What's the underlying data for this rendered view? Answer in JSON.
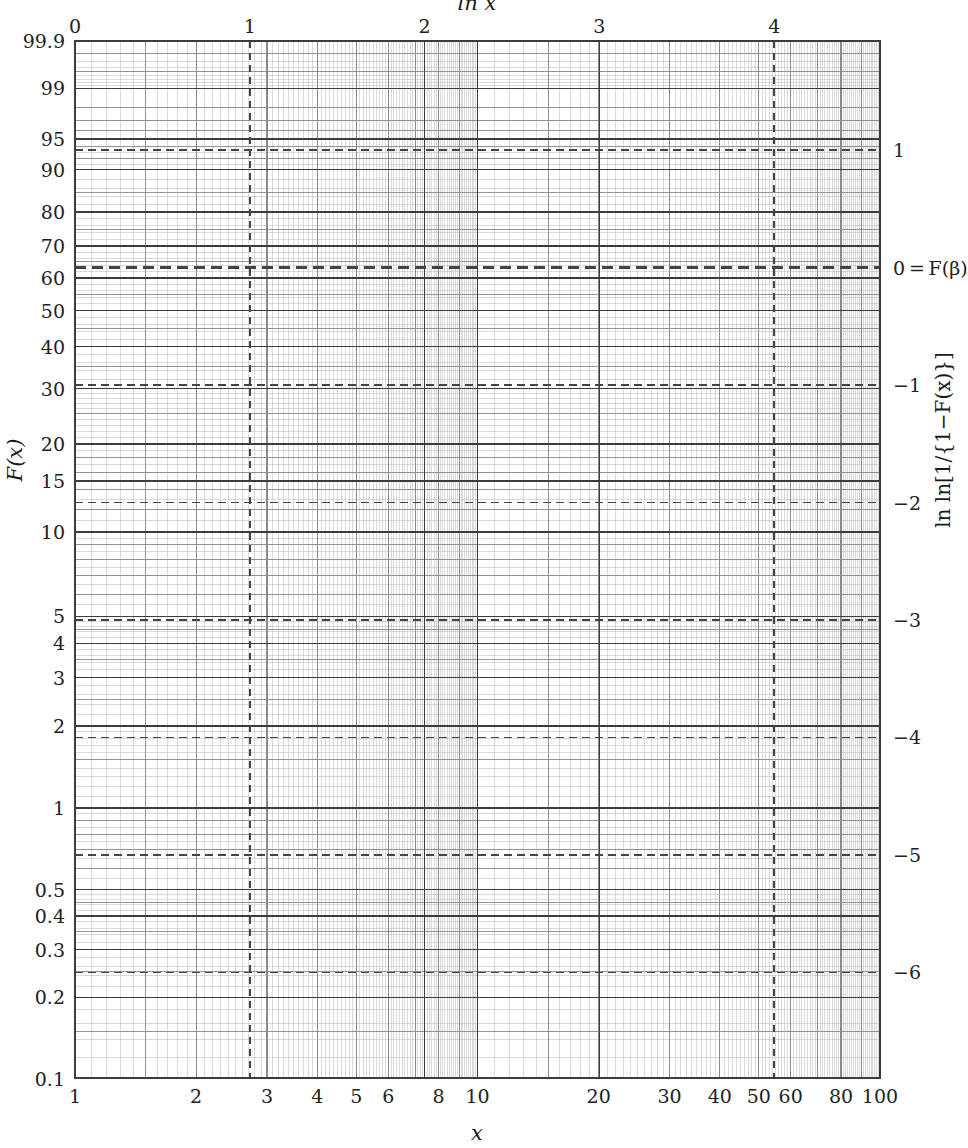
{
  "figure": {
    "type": "weibull-probability-paper",
    "width": 968,
    "height": 1148,
    "background": "#ffffff",
    "grid_color": "#3c3c3c",
    "grid_color_minor": "#8a8a8a",
    "grid_color_fine": "#b5b5b5",
    "dash_color": "#444444"
  },
  "axes": {
    "top": {
      "title": "ln x",
      "ticks": [
        "0",
        "1",
        "2",
        "3",
        "4"
      ],
      "values": [
        0,
        1,
        2,
        3,
        4
      ],
      "range": [
        0,
        4.60517
      ]
    },
    "bottom": {
      "title": "x",
      "ticks": [
        "1",
        "2",
        "3",
        "4",
        "5",
        "6",
        "8",
        "10",
        "20",
        "30",
        "40",
        "50",
        "60",
        "80",
        "100"
      ],
      "values": [
        1,
        2,
        3,
        4,
        5,
        6,
        8,
        10,
        20,
        30,
        40,
        50,
        60,
        80,
        100
      ],
      "scale": "log10",
      "range": [
        1,
        100
      ]
    },
    "left": {
      "title": "F(x)",
      "unit": "percent",
      "ticks": [
        "99.9",
        "99",
        "95",
        "90",
        "80",
        "70",
        "60",
        "50",
        "40",
        "30",
        "20",
        "15",
        "10",
        "5",
        "4",
        "3",
        "2",
        "1",
        "0.5",
        "0.4",
        "0.3",
        "0.2",
        "0.1"
      ],
      "values": [
        99.9,
        99,
        95,
        90,
        80,
        70,
        60,
        50,
        40,
        30,
        20,
        15,
        10,
        5,
        4,
        3,
        2,
        1,
        0.5,
        0.4,
        0.3,
        0.2,
        0.1
      ],
      "range": [
        0.1,
        99.9
      ]
    },
    "right": {
      "title": "ln ln[1/{1−F(x)}]",
      "ticks": [
        "1",
        "0 = F(β)",
        "−1",
        "−2",
        "−3",
        "−4",
        "−5",
        "−6"
      ],
      "values": [
        1,
        0,
        -1,
        -2,
        -3,
        -4,
        -5,
        -6
      ],
      "range": [
        -6.9,
        1.93
      ]
    }
  },
  "chart_data": {
    "type": "grid",
    "title": "",
    "xlabel": "x",
    "ylabel": "F(x)",
    "x2label": "ln x",
    "y2label": "ln ln[1/{1−F(x)}]",
    "grid": "on",
    "legend": "none",
    "xscale": "log",
    "yscale": "weibull (double-log)",
    "xlim": [
      1,
      100
    ],
    "ylim_percent": [
      0.1,
      99.9
    ],
    "ylim_lnln": [
      -6.9,
      1.93
    ],
    "xlim_lnx": [
      0,
      4.60517
    ],
    "series": [],
    "annotations": [
      {
        "kind": "dashed-vertical",
        "label": "ln x = 1",
        "x_value": 2.71828,
        "lnx": 1
      },
      {
        "kind": "dashed-vertical",
        "label": "ln x = 4",
        "x_value": 54.598,
        "lnx": 4
      },
      {
        "kind": "dashed-horizontal",
        "label": "1",
        "lnln": 1,
        "percent": 93.4
      },
      {
        "kind": "dashed-horizontal-bold",
        "label": "0 = F(β)",
        "lnln": 0,
        "percent": 63.2
      },
      {
        "kind": "dashed-horizontal",
        "label": "−1",
        "lnln": -1,
        "percent": 30.8
      },
      {
        "kind": "dashed-horizontal",
        "label": "−2",
        "lnln": -2,
        "percent": 12.7
      },
      {
        "kind": "dashed-horizontal",
        "label": "−3",
        "lnln": -3,
        "percent": 4.88
      },
      {
        "kind": "dashed-horizontal",
        "label": "−4",
        "lnln": -4,
        "percent": 1.82
      },
      {
        "kind": "dashed-horizontal",
        "label": "−5",
        "lnln": -5,
        "percent": 0.673
      },
      {
        "kind": "dashed-horizontal",
        "label": "−6",
        "lnln": -6,
        "percent": 0.248
      }
    ]
  },
  "plot_box": {
    "left": 75,
    "right": 880,
    "top": 41,
    "bottom": 1078
  }
}
